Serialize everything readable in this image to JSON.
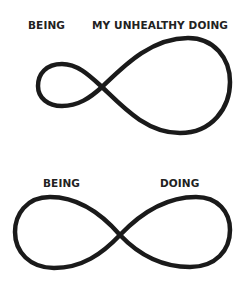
{
  "diagrams": [
    {
      "left_label": "BEING",
      "right_label": "MY UNHEALTHY DOING",
      "shape": "lopsided-infinity-loop"
    },
    {
      "left_label": "BEING",
      "right_label": "DOING",
      "shape": "balanced-infinity-loop"
    }
  ],
  "colors": {
    "stroke": "#1a1a1a",
    "text": "#222222",
    "background": "#ffffff"
  }
}
